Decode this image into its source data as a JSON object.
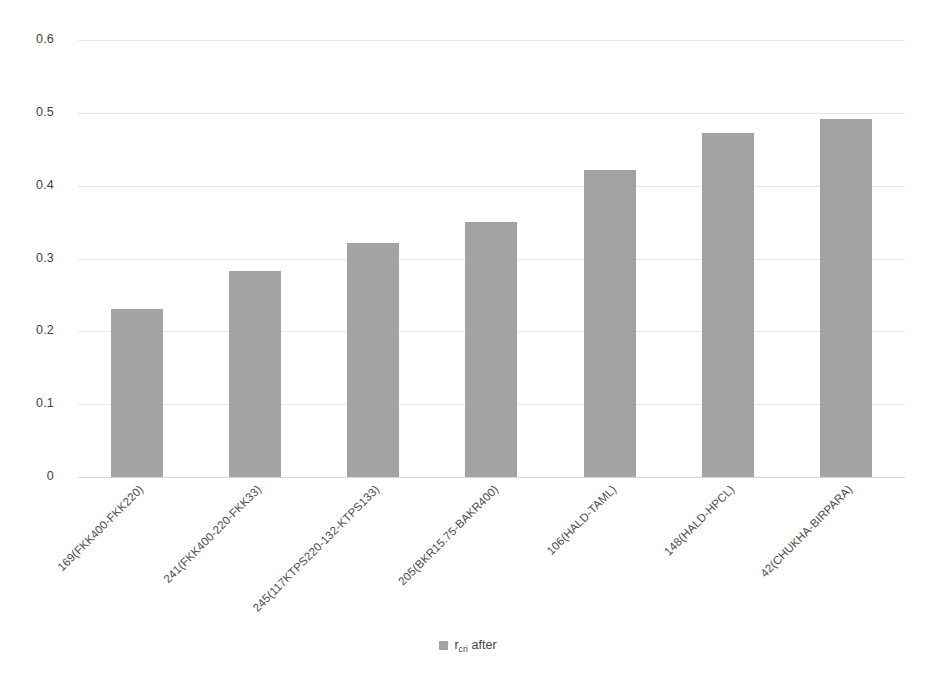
{
  "chart_data": {
    "type": "bar",
    "title": "",
    "xlabel": "",
    "ylabel": "",
    "ylim": [
      0,
      0.6
    ],
    "ytick_labels": [
      "0.6",
      "0.5",
      "0.4",
      "0.3",
      "0.2",
      "0.1",
      "0"
    ],
    "ytick_values": [
      0.6,
      0.5,
      0.4,
      0.3,
      0.2,
      0.1,
      0
    ],
    "grid": true,
    "legend_position": "bottom-center",
    "bar_color": "#a3a3a3",
    "grid_color": "#e8e8e8",
    "axis_color": "#d8d8d8",
    "categories": [
      "169(FKK400-FKK220)",
      "241(FKK400-220-FKK33)",
      "245(117KTPS220-132-KTPS133)",
      "205(BKR15.75-BAKR400)",
      "106(HALD-TAML)",
      "148(HALD-HPCL)",
      "42(CHUKHA-BIRPARA)"
    ],
    "series": [
      {
        "name": "r_cri after",
        "name_base": "r",
        "name_sub": "cri",
        "name_suffix": " after",
        "values": [
          0.231,
          0.283,
          0.321,
          0.35,
          0.422,
          0.472,
          0.491
        ]
      }
    ]
  },
  "legend": {
    "entry_base": "r",
    "entry_sub": "cri",
    "entry_suffix": " after"
  }
}
